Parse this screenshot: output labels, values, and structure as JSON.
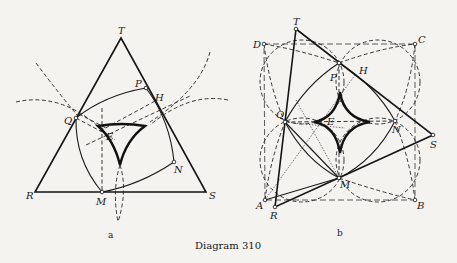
{
  "caption": "Diagram 310",
  "figures": [
    {
      "id": "a",
      "sublabel": "a",
      "description": "Equilateral triangle RST with deltoid (three-cusped hypocycloid) inside; Simson line construction",
      "points": {
        "T": "T",
        "R": "R",
        "S": "S",
        "P": "P",
        "H": "H",
        "Q": "Q",
        "E": "E",
        "N": "N",
        "M": "M"
      }
    },
    {
      "id": "b",
      "sublabel": "b",
      "description": "Square ABCD with four dashed circles and astroid (four-cusped hypocycloid) inside; triangle RST",
      "points": {
        "T": "T",
        "D": "D",
        "C": "C",
        "P": "P",
        "H": "H",
        "Q": "Q",
        "E": "E",
        "N": "N",
        "S": "S",
        "M": "M",
        "A": "A",
        "R": "R",
        "B": "B"
      }
    }
  ]
}
